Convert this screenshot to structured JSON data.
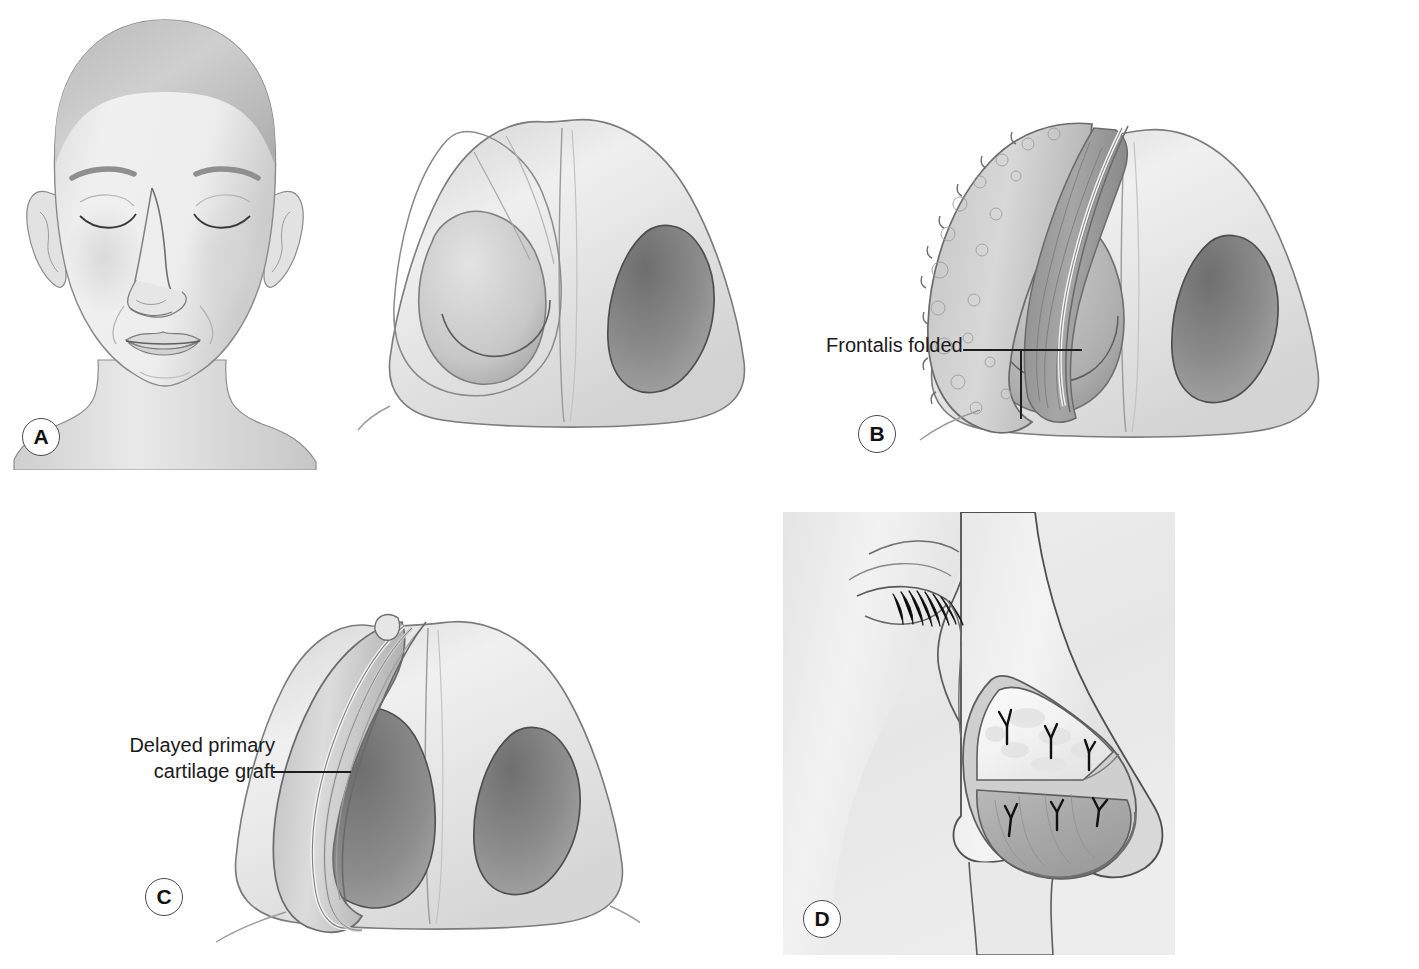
{
  "figure": {
    "background_color": "#ffffff",
    "width": 1419,
    "height": 969,
    "style": "grayscale medical line-and-wash illustration"
  },
  "panels": [
    {
      "id": "a",
      "letter": "A",
      "caption": "",
      "view": "frontal view of face with closed eyes, bald head, showing left nasal ala defect",
      "labels": []
    },
    {
      "id": "basal-defect",
      "letter": "",
      "caption": "",
      "view": "basal (worm's eye) view of nose showing left alar defect and obliterated nostril",
      "labels": []
    },
    {
      "id": "b",
      "letter": "B",
      "caption": "",
      "view": "basal view of nose with bulky folded frontalis muscle flap filling the left nostril",
      "labels": [
        {
          "text": "Frontalis folded"
        }
      ]
    },
    {
      "id": "c",
      "letter": "C",
      "caption": "",
      "view": "basal view of nose after flap thinning with curved cartilage graft lining the left ala",
      "labels": [
        {
          "text": "Delayed primary\ncartilage graft",
          "line1": "Delayed primary",
          "line2": "cartilage graft"
        }
      ]
    },
    {
      "id": "d",
      "letter": "D",
      "caption": "",
      "view": "lateral profile of the nose with inset graft and suture fixation",
      "labels": [],
      "suture_count": 6
    }
  ],
  "colors": {
    "ink": "#1d1d1d",
    "label_text": "#1a1a1a",
    "letter_circle_border": "#4a4a4a",
    "skin_light": "#f2f2f2",
    "skin_mid": "#d8d8d8",
    "skin_shadow": "#a9a9a9",
    "nostril_dark": "#8c8c8c",
    "nostril_darker": "#707070",
    "flap_tissue": "#9d9d9d",
    "graft_white": "#f7f7f7",
    "panel_d_background": "#eeeeee"
  }
}
